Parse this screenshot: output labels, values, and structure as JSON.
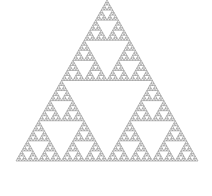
{
  "figure": {
    "type": "sierpinski-triangle",
    "width": 212,
    "height": 196,
    "background": "#ffffff",
    "fill_color": "#8c8c8c",
    "depth": 6,
    "apex": [
      107,
      0
    ],
    "base_left": [
      16,
      161
    ],
    "base_right": [
      198,
      161
    ]
  }
}
